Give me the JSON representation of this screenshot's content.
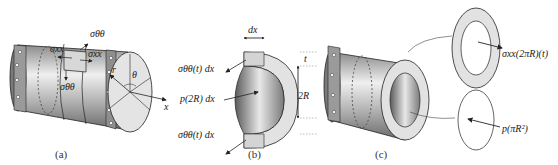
{
  "figure": {
    "panels": [
      {
        "id": "a",
        "caption": "(a)",
        "description": "Thin-walled pressurized cylinder with flanged ends, showing stress element",
        "labels": {
          "hoop_stress_top": "σθθ",
          "axial_stress_left": "σxx",
          "axial_stress_right": "σxx",
          "hoop_stress_bottom": "σθθ",
          "radius": "r",
          "angle": "θ",
          "axis": "x"
        }
      },
      {
        "id": "b",
        "caption": "(b)",
        "description": "Half-ring slice of length dx for hoop stress equilibrium",
        "labels": {
          "width": "dx",
          "thickness": "t",
          "diameter": "2R",
          "top_force": "σθθ(t) dx",
          "pressure_force": "p(2R) dx",
          "bottom_force": "σθθ(t) dx"
        }
      },
      {
        "id": "c",
        "caption": "(c)",
        "description": "Cylinder cut transversely for axial stress equilibrium",
        "labels": {
          "axial_force": "σxx(2πR)(t)",
          "pressure_force": "p(πR²)"
        }
      }
    ],
    "colors": {
      "metal_dark": "#6e6e6e",
      "metal_light": "#e6e6e6",
      "section_face": "#e2e2e2",
      "line": "#222222"
    }
  }
}
